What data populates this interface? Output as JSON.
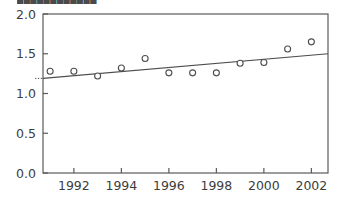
{
  "title_clipped": "████████████",
  "chart_data": {
    "type": "scatter",
    "title": "",
    "subtitle": "",
    "xlabel": "",
    "ylabel": "",
    "xlim": [
      1990.7,
      2002.7
    ],
    "ylim": [
      0.0,
      2.0
    ],
    "grid": false,
    "legend": null,
    "x": [
      1991,
      1992,
      1993,
      1994,
      1995,
      1996,
      1997,
      1998,
      1999,
      2000,
      2001,
      2002
    ],
    "values": [
      1.28,
      1.28,
      1.22,
      1.32,
      1.44,
      1.26,
      1.26,
      1.26,
      1.38,
      1.39,
      1.56,
      1.65
    ],
    "series": [
      {
        "name": "observations",
        "type": "scatter",
        "marker": "open-circle",
        "color": "#4d4d4d",
        "values": [
          1.28,
          1.28,
          1.22,
          1.32,
          1.44,
          1.26,
          1.26,
          1.26,
          1.38,
          1.39,
          1.56,
          1.65
        ]
      },
      {
        "name": "trend-line",
        "type": "line",
        "color": "#4d4d4d",
        "x": [
          1990.7,
          2002.7
        ],
        "values": [
          1.19,
          1.5
        ]
      }
    ],
    "xticks": [
      1992,
      1994,
      1996,
      1998,
      2000,
      2002
    ],
    "xtick_labels": [
      "1992",
      "1994",
      "1996",
      "1998",
      "2000",
      "2002"
    ],
    "yticks": [
      0.0,
      0.5,
      1.0,
      1.5,
      2.0
    ],
    "ytick_labels": [
      "0.0",
      "0.5",
      "1.0",
      "1.5",
      "2.0"
    ],
    "axis_color": "#5a5a5a",
    "marker_color": "#4d4d4d",
    "line_color": "#4d4d4d",
    "background": "#ffffff"
  }
}
